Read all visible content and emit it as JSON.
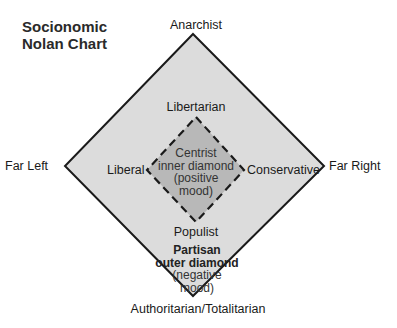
{
  "title": {
    "line1": "Socionomic",
    "line2": "Nolan Chart"
  },
  "colors": {
    "outer_fill": "#dcdcdc",
    "inner_fill": "#b8b8b8",
    "stroke": "#1a1a1a",
    "background": "#ffffff"
  },
  "outer_axis_labels": {
    "top": "Anarchist",
    "left": "Far Left",
    "right": "Far Right",
    "bottom": "Authoritarian/Totalitarian"
  },
  "inner_axis_labels": {
    "top": "Libertarian",
    "left": "Liberal",
    "right": "Conservative",
    "bottom": "Populist"
  },
  "inner_diamond": {
    "line1": "Centrist",
    "line2": "inner diamond",
    "line3": "(positive",
    "line4": "mood)"
  },
  "outer_diamond": {
    "line1": "Partisan",
    "line2": "outer diamond",
    "line3": "(negative",
    "line4": "mood)"
  }
}
